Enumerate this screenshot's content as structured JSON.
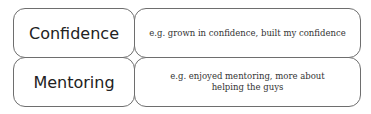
{
  "rows": [
    {
      "label": "Confidence",
      "description": "e.g. grown in confidence, built my confidence"
    },
    {
      "label": "Mentoring",
      "description_line1": "e.g. enjoyed mentoring, more about",
      "description_line2": "helping the guys"
    }
  ],
  "colors": {
    "border": "#6e6e6e",
    "text": "#222222",
    "background": "#ffffff"
  }
}
